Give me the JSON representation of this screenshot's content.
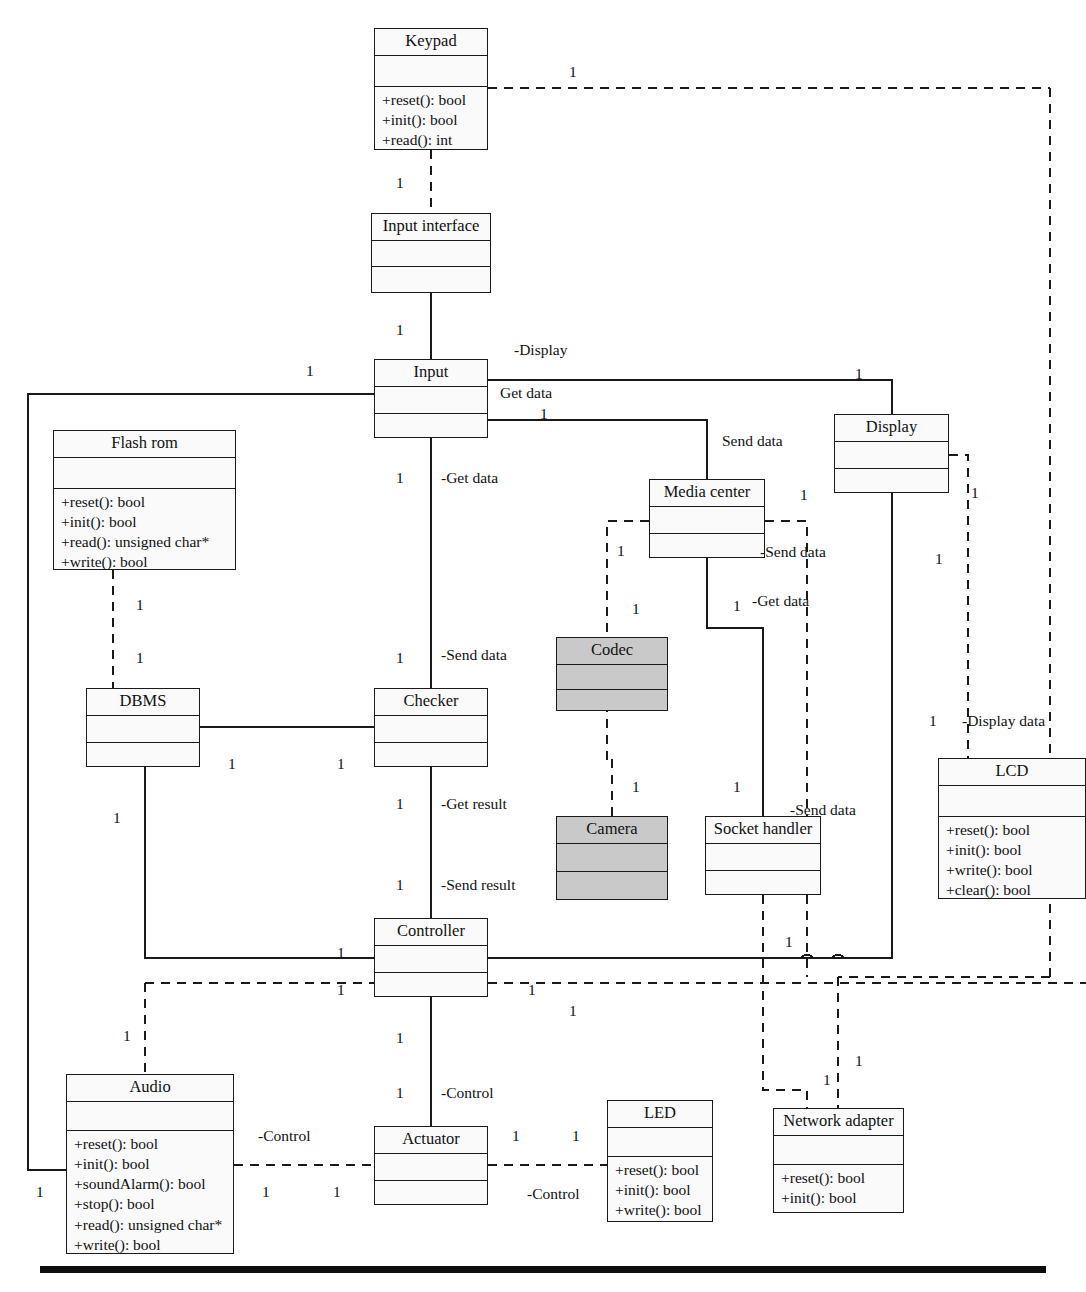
{
  "diagram": {
    "bottom_rule": true,
    "classes": [
      {
        "id": "keypad",
        "name": "Keypad",
        "x": 374,
        "y": 28,
        "w": 114,
        "h": 122,
        "attrs_h": 30,
        "operations": [
          "+reset(): bool",
          "+init(): bool",
          "+read(): int"
        ],
        "shaded": false
      },
      {
        "id": "input_interface",
        "name": "Input interface",
        "x": 371,
        "y": 213,
        "w": 120,
        "h": 80,
        "attrs_h": 25,
        "operations": [],
        "shaded": false
      },
      {
        "id": "input",
        "name": "Input",
        "x": 374,
        "y": 359,
        "w": 114,
        "h": 79,
        "attrs_h": 26,
        "operations": [],
        "shaded": false
      },
      {
        "id": "display",
        "name": "Display",
        "x": 834,
        "y": 414,
        "w": 115,
        "h": 79,
        "attrs_h": 26,
        "operations": [],
        "shaded": false
      },
      {
        "id": "flash_rom",
        "name": "Flash rom",
        "x": 53,
        "y": 430,
        "w": 183,
        "h": 140,
        "attrs_h": 30,
        "operations": [
          "+reset(): bool",
          "+init(): bool",
          "+read(): unsigned char*",
          "+write(): bool"
        ],
        "shaded": false
      },
      {
        "id": "media_center",
        "name": "Media center",
        "x": 649,
        "y": 479,
        "w": 116,
        "h": 79,
        "attrs_h": 26,
        "operations": [],
        "shaded": false
      },
      {
        "id": "codec",
        "name": "Codec",
        "x": 556,
        "y": 637,
        "w": 112,
        "h": 74,
        "attrs_h": 24,
        "operations": [],
        "shaded": true
      },
      {
        "id": "dbms",
        "name": "DBMS",
        "x": 86,
        "y": 688,
        "w": 114,
        "h": 79,
        "attrs_h": 26,
        "operations": [],
        "shaded": false
      },
      {
        "id": "checker",
        "name": "Checker",
        "x": 374,
        "y": 688,
        "w": 114,
        "h": 79,
        "attrs_h": 26,
        "operations": [],
        "shaded": false
      },
      {
        "id": "lcd",
        "name": "LCD",
        "x": 938,
        "y": 758,
        "w": 148,
        "h": 141,
        "attrs_h": 30,
        "operations": [
          "+reset(): bool",
          "+init(): bool",
          "+write(): bool",
          "+clear(): bool"
        ],
        "shaded": false
      },
      {
        "id": "camera",
        "name": "Camera",
        "x": 556,
        "y": 816,
        "w": 112,
        "h": 84,
        "attrs_h": 27,
        "operations": [],
        "shaded": true
      },
      {
        "id": "socket_handler",
        "name": "Socket handler",
        "x": 705,
        "y": 816,
        "w": 116,
        "h": 79,
        "attrs_h": 26,
        "operations": [],
        "shaded": false
      },
      {
        "id": "controller",
        "name": "Controller",
        "x": 374,
        "y": 918,
        "w": 114,
        "h": 79,
        "attrs_h": 26,
        "operations": [],
        "shaded": false
      },
      {
        "id": "audio",
        "name": "Audio",
        "x": 66,
        "y": 1074,
        "w": 168,
        "h": 180,
        "attrs_h": 28,
        "operations": [
          "+reset(): bool",
          "+init(): bool",
          "+soundAlarm(): bool",
          "+stop(): bool",
          "+read(): unsigned char*",
          "+write(): bool"
        ],
        "shaded": false
      },
      {
        "id": "led",
        "name": "LED",
        "x": 607,
        "y": 1100,
        "w": 106,
        "h": 122,
        "attrs_h": 28,
        "operations": [
          "+reset(): bool",
          "+init(): bool",
          "+write(): bool"
        ],
        "shaded": false
      },
      {
        "id": "network_adapter",
        "name": "Network adapter",
        "x": 773,
        "y": 1108,
        "w": 131,
        "h": 105,
        "attrs_h": 28,
        "operations": [
          "+reset(): bool",
          "+init(): bool"
        ],
        "shaded": false
      },
      {
        "id": "actuator",
        "name": "Actuator",
        "x": 374,
        "y": 1126,
        "w": 114,
        "h": 79,
        "attrs_h": 26,
        "operations": [],
        "shaded": false
      }
    ],
    "role_labels": [
      {
        "id": "lbl-display",
        "text": "-Display",
        "x": 514,
        "y": 342
      },
      {
        "id": "lbl-get-data-1",
        "text": "Get data",
        "x": 500,
        "y": 385
      },
      {
        "id": "lbl-send-data-1",
        "text": "Send data",
        "x": 722,
        "y": 433
      },
      {
        "id": "lbl-get-data-2",
        "text": "-Get data",
        "x": 441,
        "y": 470
      },
      {
        "id": "lbl-send-data-2",
        "text": "-Send data",
        "x": 760,
        "y": 544
      },
      {
        "id": "lbl-get-data-3",
        "text": "-Get data",
        "x": 752,
        "y": 593
      },
      {
        "id": "lbl-send-data-3",
        "text": "-Send data",
        "x": 441,
        "y": 647
      },
      {
        "id": "lbl-display-data",
        "text": "-Display data",
        "x": 962,
        "y": 713
      },
      {
        "id": "lbl-send-data-4",
        "text": "-Send data",
        "x": 790,
        "y": 802
      },
      {
        "id": "lbl-get-result",
        "text": "-Get result",
        "x": 441,
        "y": 796
      },
      {
        "id": "lbl-send-result",
        "text": "-Send result",
        "x": 441,
        "y": 877
      },
      {
        "id": "lbl-control-1",
        "text": "-Control",
        "x": 441,
        "y": 1085
      },
      {
        "id": "lbl-control-2",
        "text": "-Control",
        "x": 258,
        "y": 1128
      },
      {
        "id": "lbl-control-3",
        "text": "-Control",
        "x": 527,
        "y": 1186
      }
    ],
    "multiplicities": [
      {
        "id": "m-keypad-right",
        "text": "1",
        "x": 569,
        "y": 64
      },
      {
        "id": "m-keypad-bottom",
        "text": "1",
        "x": 396,
        "y": 175
      },
      {
        "id": "m-ii-bottom",
        "text": "1",
        "x": 396,
        "y": 322
      },
      {
        "id": "m-input-left",
        "text": "1",
        "x": 306,
        "y": 363
      },
      {
        "id": "m-display-top",
        "text": "1",
        "x": 855,
        "y": 366
      },
      {
        "id": "m-getdata-1",
        "text": "1",
        "x": 540,
        "y": 406
      },
      {
        "id": "m-flash-bottom",
        "text": "1",
        "x": 136,
        "y": 597
      },
      {
        "id": "m-dbms-top",
        "text": "1",
        "x": 136,
        "y": 650
      },
      {
        "id": "m-input-down",
        "text": "1",
        "x": 396,
        "y": 470
      },
      {
        "id": "m-mc-left",
        "text": "1",
        "x": 617,
        "y": 543
      },
      {
        "id": "m-mc-right",
        "text": "1",
        "x": 800,
        "y": 487
      },
      {
        "id": "m-codec-top",
        "text": "1",
        "x": 632,
        "y": 601
      },
      {
        "id": "m-mc-getdata",
        "text": "1",
        "x": 733,
        "y": 598
      },
      {
        "id": "m-display-right",
        "text": "1",
        "x": 971,
        "y": 485
      },
      {
        "id": "m-display-down",
        "text": "1",
        "x": 935,
        "y": 551
      },
      {
        "id": "m-checker-top",
        "text": "1",
        "x": 396,
        "y": 650
      },
      {
        "id": "m-dbms-right",
        "text": "1",
        "x": 228,
        "y": 756
      },
      {
        "id": "m-checker-left",
        "text": "1",
        "x": 337,
        "y": 756
      },
      {
        "id": "m-dbms-down",
        "text": "1",
        "x": 113,
        "y": 810
      },
      {
        "id": "m-checker-down-1",
        "text": "1",
        "x": 396,
        "y": 796
      },
      {
        "id": "m-checker-down-2",
        "text": "1",
        "x": 396,
        "y": 877
      },
      {
        "id": "m-camera-top",
        "text": "1",
        "x": 632,
        "y": 779
      },
      {
        "id": "m-socket-top",
        "text": "1",
        "x": 733,
        "y": 779
      },
      {
        "id": "m-lcd-top",
        "text": "1",
        "x": 929,
        "y": 713
      },
      {
        "id": "m-ctrl-left-1",
        "text": "1",
        "x": 337,
        "y": 945
      },
      {
        "id": "m-ctrl-left-2",
        "text": "1",
        "x": 337,
        "y": 982
      },
      {
        "id": "m-ctrl-right-1",
        "text": "1",
        "x": 785,
        "y": 934
      },
      {
        "id": "m-ctrl-right-2",
        "text": "1",
        "x": 528,
        "y": 982
      },
      {
        "id": "m-ctrl-right-3",
        "text": "1",
        "x": 569,
        "y": 1003
      },
      {
        "id": "m-audio-top",
        "text": "1",
        "x": 123,
        "y": 1028
      },
      {
        "id": "m-ctrl-down",
        "text": "1",
        "x": 396,
        "y": 1030
      },
      {
        "id": "m-actuator-top",
        "text": "1",
        "x": 396,
        "y": 1085
      },
      {
        "id": "m-actuator-right",
        "text": "1",
        "x": 512,
        "y": 1128
      },
      {
        "id": "m-led-left",
        "text": "1",
        "x": 572,
        "y": 1128
      },
      {
        "id": "m-audio-left",
        "text": "1",
        "x": 36,
        "y": 1184
      },
      {
        "id": "m-audio-right",
        "text": "1",
        "x": 262,
        "y": 1184
      },
      {
        "id": "m-actuator-left",
        "text": "1",
        "x": 333,
        "y": 1184
      },
      {
        "id": "m-na-right",
        "text": "1",
        "x": 855,
        "y": 1053
      },
      {
        "id": "m-na-left",
        "text": "1",
        "x": 823,
        "y": 1072
      }
    ]
  }
}
